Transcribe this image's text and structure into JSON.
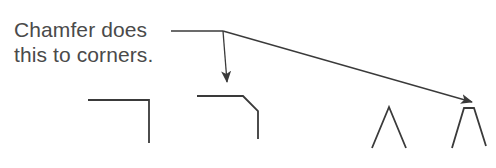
{
  "caption": {
    "line1": "Chamfer does",
    "line2": "this to corners."
  },
  "colors": {
    "stroke": "#3a3a3a",
    "text": "#4a4a4a",
    "background": "#ffffff"
  },
  "figures": [
    {
      "name": "square-corner",
      "description": "Right-angle corner before chamfer"
    },
    {
      "name": "chamfered-corner",
      "description": "Corner with chamfer applied"
    },
    {
      "name": "sharp-peak",
      "description": "Acute peak before chamfer"
    },
    {
      "name": "chamfered-peak",
      "description": "Acute peak with chamfer applied"
    }
  ]
}
